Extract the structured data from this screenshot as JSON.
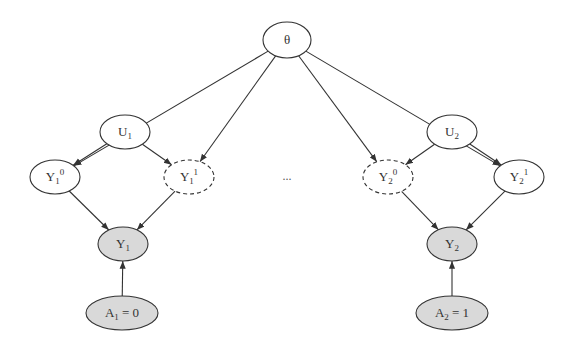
{
  "diagram": {
    "nodes": [
      {
        "id": "theta",
        "label": "θ",
        "base": "θ",
        "sub": "",
        "sup": "",
        "x": 287,
        "y": 40,
        "rx": 24,
        "ry": 18,
        "style": "solid",
        "fill": "#ffffff"
      },
      {
        "id": "U1",
        "label": "U1",
        "base": "U",
        "sub": "1",
        "sup": "",
        "x": 125,
        "y": 132,
        "rx": 25,
        "ry": 17,
        "style": "solid",
        "fill": "#ffffff"
      },
      {
        "id": "U2",
        "label": "U2",
        "base": "U",
        "sub": "2",
        "sup": "",
        "x": 452,
        "y": 132,
        "rx": 25,
        "ry": 17,
        "style": "solid",
        "fill": "#ffffff"
      },
      {
        "id": "Y1_0",
        "label": "Y1^0",
        "base": "Y",
        "sub": "1",
        "sup": "0",
        "x": 55,
        "y": 177,
        "rx": 25,
        "ry": 17,
        "style": "solid",
        "fill": "#ffffff"
      },
      {
        "id": "Y1_1",
        "label": "Y1^1",
        "base": "Y",
        "sub": "1",
        "sup": "1",
        "x": 189,
        "y": 177,
        "rx": 25,
        "ry": 17,
        "style": "dashed",
        "fill": "#ffffff"
      },
      {
        "id": "Y2_0",
        "label": "Y2^0",
        "base": "Y",
        "sub": "2",
        "sup": "0",
        "x": 388,
        "y": 177,
        "rx": 25,
        "ry": 17,
        "style": "dashed",
        "fill": "#ffffff"
      },
      {
        "id": "Y2_1",
        "label": "Y2^1",
        "base": "Y",
        "sub": "2",
        "sup": "1",
        "x": 519,
        "y": 177,
        "rx": 25,
        "ry": 17,
        "style": "solid",
        "fill": "#ffffff"
      },
      {
        "id": "Y1",
        "label": "Y1",
        "base": "Y",
        "sub": "1",
        "sup": "",
        "x": 123,
        "y": 244,
        "rx": 25,
        "ry": 17,
        "style": "solid",
        "fill": "#d9d9d9"
      },
      {
        "id": "Y2",
        "label": "Y2",
        "base": "Y",
        "sub": "2",
        "sup": "",
        "x": 452,
        "y": 244,
        "rx": 25,
        "ry": 17,
        "style": "solid",
        "fill": "#d9d9d9"
      },
      {
        "id": "A1",
        "label": "A1 = 0",
        "base": "A",
        "sub": "1",
        "sup": "",
        "suffix": " = 0",
        "x": 122,
        "y": 313,
        "rx": 36,
        "ry": 17,
        "style": "solid",
        "fill": "#d9d9d9"
      },
      {
        "id": "A2",
        "label": "A2 = 1",
        "base": "A",
        "sub": "2",
        "sup": "",
        "suffix": " = 1",
        "x": 452,
        "y": 313,
        "rx": 36,
        "ry": 17,
        "style": "solid",
        "fill": "#d9d9d9"
      }
    ],
    "edges": [
      {
        "from": "theta",
        "to": "Y1_0"
      },
      {
        "from": "theta",
        "to": "Y1_1"
      },
      {
        "from": "theta",
        "to": "Y2_0"
      },
      {
        "from": "theta",
        "to": "Y2_1"
      },
      {
        "from": "U1",
        "to": "Y1_0"
      },
      {
        "from": "U1",
        "to": "Y1_1"
      },
      {
        "from": "U2",
        "to": "Y2_0"
      },
      {
        "from": "U2",
        "to": "Y2_1"
      },
      {
        "from": "Y1_0",
        "to": "Y1"
      },
      {
        "from": "Y1_1",
        "to": "Y1"
      },
      {
        "from": "Y2_0",
        "to": "Y2"
      },
      {
        "from": "Y2_1",
        "to": "Y2"
      },
      {
        "from": "A1",
        "to": "Y1"
      },
      {
        "from": "A2",
        "to": "Y2"
      }
    ],
    "ellipsis": {
      "text": "...",
      "x": 287,
      "y": 180
    },
    "colors": {
      "stroke": "#333333",
      "observed_fill": "#d9d9d9",
      "latent_fill": "#ffffff"
    }
  }
}
